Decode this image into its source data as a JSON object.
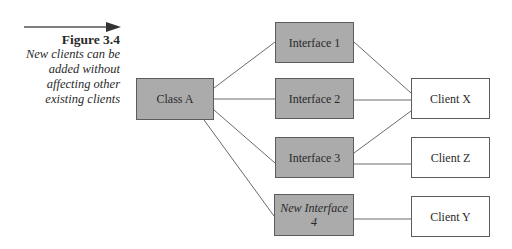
{
  "caption": {
    "figure_label": "Figure 3.4",
    "description_lines": [
      "New clients can be",
      "added without",
      "affecting other",
      "existing clients"
    ]
  },
  "diagram": {
    "nodes": {
      "class_a": {
        "label": "Class A",
        "style": "filled"
      },
      "interface_1": {
        "label": "Interface 1",
        "style": "filled"
      },
      "interface_2": {
        "label": "Interface 2",
        "style": "filled"
      },
      "interface_3": {
        "label": "Interface 3",
        "style": "filled"
      },
      "interface_4": {
        "label_line1": "New Interface",
        "label_line2": "4",
        "style": "filled-italic"
      },
      "client_x": {
        "label": "Client X",
        "style": "plain"
      },
      "client_z": {
        "label": "Client Z",
        "style": "plain"
      },
      "client_y": {
        "label": "Client Y",
        "style": "plain"
      }
    },
    "edges": [
      {
        "from": "class_a",
        "to": "interface_1"
      },
      {
        "from": "class_a",
        "to": "interface_2"
      },
      {
        "from": "class_a",
        "to": "interface_3"
      },
      {
        "from": "class_a",
        "to": "interface_4"
      },
      {
        "from": "interface_1",
        "to": "client_x"
      },
      {
        "from": "interface_2",
        "to": "client_x"
      },
      {
        "from": "interface_3",
        "to": "client_x"
      },
      {
        "from": "interface_3",
        "to": "client_z"
      },
      {
        "from": "interface_4",
        "to": "client_y"
      }
    ],
    "colors": {
      "box_fill": "#ababab",
      "box_border": "#5c5c5c",
      "line": "#6a6a6a",
      "text": "#2a2a2a"
    }
  }
}
